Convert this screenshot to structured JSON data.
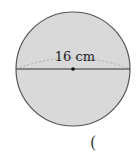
{
  "diagram": {
    "shape": "sphere",
    "diameter_label": "16 cm",
    "fill_color": "#d9d9d9",
    "stroke_color": "#555555",
    "answer_paren": "("
  }
}
